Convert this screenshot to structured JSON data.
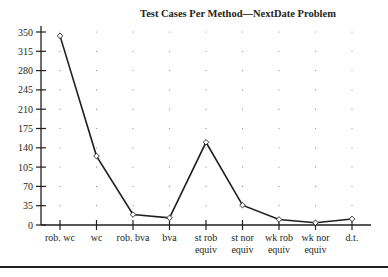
{
  "chart_data": {
    "type": "line",
    "title": "Test Cases Per Method—NextDate Problem",
    "xlabel": "",
    "ylabel": "",
    "categories": [
      [
        "rob. wc"
      ],
      [
        "wc"
      ],
      [
        "rob. bva"
      ],
      [
        "bva"
      ],
      [
        "st rob",
        "equiv"
      ],
      [
        "st nor",
        "equiv"
      ],
      [
        "wk rob",
        "equiv"
      ],
      [
        "wk nor",
        "equiv"
      ],
      [
        "d.t."
      ]
    ],
    "series": [
      {
        "name": "Test cases",
        "values": [
          343,
          125,
          19,
          13,
          150,
          36,
          10,
          4,
          11
        ],
        "marker": "diamond-open"
      }
    ],
    "yticks": [
      0,
      35,
      70,
      105,
      140,
      175,
      210,
      245,
      280,
      315,
      350
    ],
    "ylim": [
      0,
      350
    ],
    "grid": "dotted",
    "legend": "none"
  },
  "colors": {
    "ink": "#231f20",
    "grid": "#8a8a8a"
  }
}
